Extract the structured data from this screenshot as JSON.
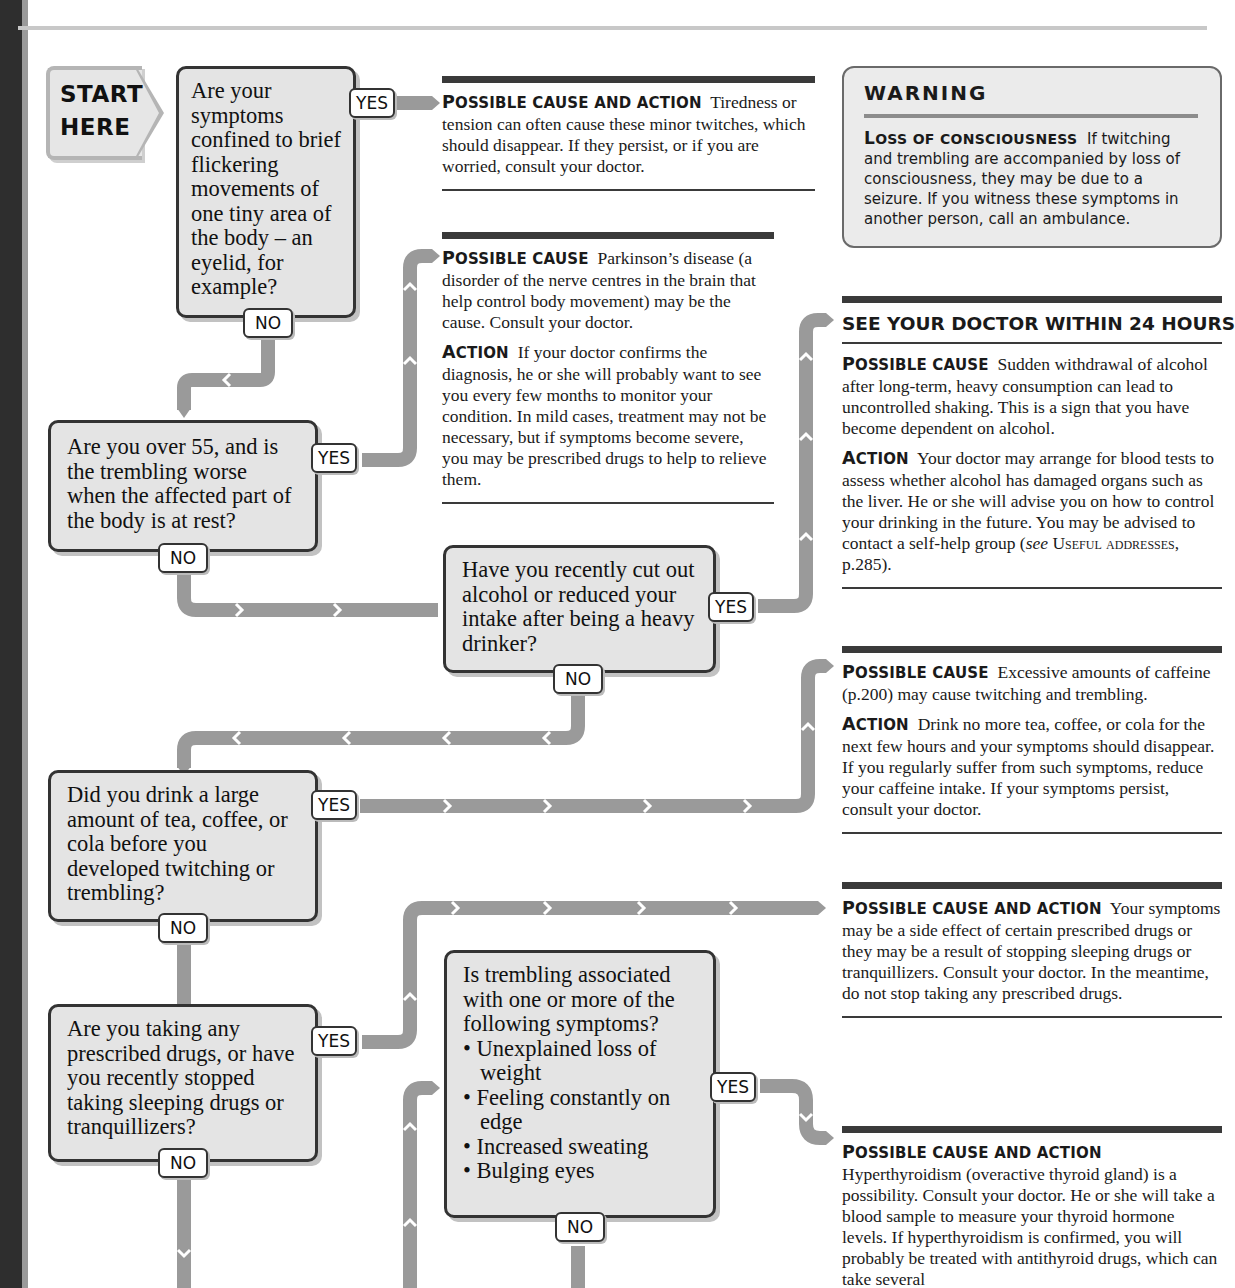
{
  "colors": {
    "connector": "#9a9a9a",
    "question_fill": "#e4e4e4",
    "question_border": "#333333",
    "rule": "#3a3a3a",
    "warning_fill": "#ebebeb"
  },
  "start": {
    "line1": "START",
    "line2": "HERE"
  },
  "labels": {
    "yes": "YES",
    "no": "NO"
  },
  "questions": [
    {
      "id": "q1",
      "text": "Are your symptoms confined to brief flickering movements of one tiny area of the body – an eyelid, for example?"
    },
    {
      "id": "q2",
      "text": "Are you over 55, and is the trembling worse when the affected part of the body is at rest?"
    },
    {
      "id": "q3",
      "text": "Have you recently cut out alcohol or reduced your intake after being a heavy drinker?"
    },
    {
      "id": "q4",
      "text": "Did you drink a large amount of tea, coffee, or cola before you developed twitching or trembling?"
    },
    {
      "id": "q5",
      "text": "Are you taking any prescribed drugs, or have you recently stopped taking sleeping drugs or tranquillizers?"
    },
    {
      "id": "q6",
      "text": "Is trembling associated with one or more of the following symptoms?",
      "bullets": [
        "Unexplained loss of weight",
        "Feeling constantly on edge",
        "Increased sweating",
        "Bulging eyes"
      ]
    }
  ],
  "warning": {
    "title": "WARNING",
    "heading_first": "L",
    "heading_rest": "OSS OF CONSCIOUSNESS",
    "text": "If twitching and trembling are accompanied by loss of consciousness, they may be due to a seizure. If you witness these symptoms in another person, call an ambulance."
  },
  "results": [
    {
      "id": "r1",
      "sections": [
        {
          "head_first": "P",
          "head_rest": "OSSIBLE CAUSE AND ACTION",
          "text": "Tiredness or tension can often cause these minor twitches, which should disappear. If they persist, or if you are worried, consult your doctor."
        }
      ]
    },
    {
      "id": "r2",
      "sections": [
        {
          "head_first": "P",
          "head_rest": "OSSIBLE CAUSE",
          "text": "Parkinson’s disease (a disorder of the nerve centres in the brain that help control body movement) may be the cause. Consult your doctor."
        },
        {
          "head_first": "A",
          "head_rest": "CTION",
          "text": "If your doctor confirms the diagnosis, he or she will probably want to see you every few months to monitor your condition. In mild cases, treatment may not be necessary, but if symptoms become severe, you may be prescribed drugs to help to relieve them."
        }
      ]
    },
    {
      "id": "r3",
      "urgency": "SEE YOUR DOCTOR WITHIN 24 HOURS",
      "sections": [
        {
          "head_first": "P",
          "head_rest": "OSSIBLE CAUSE",
          "text": "Sudden withdrawal of alcohol after long-term, heavy consumption can lead to uncontrolled shaking. This is a sign that you have become dependent on alcohol."
        },
        {
          "head_first": "A",
          "head_rest": "CTION",
          "text": "Your doctor may arrange for blood tests to assess whether alcohol has damaged organs such as the liver. He or she will advise you on how to control your drinking in the future. You may be advised to contact a self-help group (",
          "see_word": "see",
          "ref": "Useful addresses",
          "ref_tail": ", p.285)."
        }
      ]
    },
    {
      "id": "r4",
      "sections": [
        {
          "head_first": "P",
          "head_rest": "OSSIBLE CAUSE",
          "text": "Excessive amounts of caffeine (p.200) may cause twitching and trembling."
        },
        {
          "head_first": "A",
          "head_rest": "CTION",
          "text": "Drink no more tea, coffee, or cola for the next few hours and your symptoms should disappear. If you regularly suffer from such symptoms, reduce your caffeine intake. If your symptoms persist, consult your doctor."
        }
      ]
    },
    {
      "id": "r5",
      "sections": [
        {
          "head_first": "P",
          "head_rest": "OSSIBLE CAUSE AND ACTION",
          "text": "Your symptoms may be a side effect of certain prescribed drugs or they may be a result of stopping sleeping drugs or tranquillizers. Consult your doctor. In the meantime, do not stop taking any prescribed drugs."
        }
      ]
    },
    {
      "id": "r6",
      "sections": [
        {
          "head_first": "P",
          "head_rest": "OSSIBLE CAUSE AND ACTION",
          "text": "Hyperthyroidism (overactive thyroid gland) is a possibility. Consult your doctor. He or she will take a blood sample to measure your thyroid hormone levels. If hyperthyroidism is confirmed, you will probably be treated with antithyroid drugs, which can take several"
        }
      ]
    }
  ]
}
